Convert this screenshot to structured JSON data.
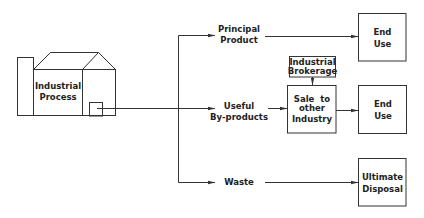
{
  "diagram": {
    "type": "flow",
    "colors": {
      "stroke": "#333333",
      "text": "#222222",
      "background": "#ffffff"
    },
    "source": {
      "label_line1": "Industrial",
      "label_line2": "Process",
      "icon": "factory-icon"
    },
    "branches": {
      "principal": {
        "label_line1": "Principal",
        "label_line2": "Product"
      },
      "useful": {
        "label_line1": "Useful",
        "label_line2": "By-products"
      },
      "waste": {
        "label": "Waste"
      }
    },
    "boxes": {
      "brokerage": {
        "line1": "Industrial",
        "line2": "Brokerage"
      },
      "sale": {
        "line1": "Sale  to",
        "line2": "other",
        "line3": "Industry"
      },
      "end_use_top": {
        "line1": "End",
        "line2": "Use"
      },
      "end_use_mid": {
        "line1": "End",
        "line2": "Use"
      },
      "disposal": {
        "line1": "Ultimate",
        "line2": "Disposal"
      }
    }
  }
}
